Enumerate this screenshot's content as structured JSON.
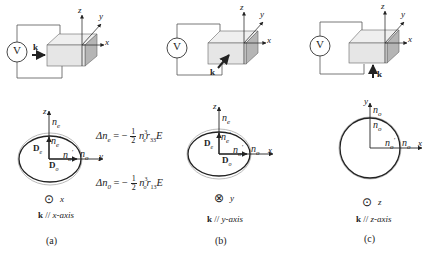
{
  "panels": [
    {
      "id": "a",
      "caption": "(a)",
      "k_direction_label": "k // x-axis",
      "k_bold": "k",
      "k_rest": " // ",
      "axis_name": "x-axis",
      "view_symbol": "⊙",
      "view_axis": "x",
      "voltage_label": "V",
      "k_arrow_label": "k",
      "crystal_axes": {
        "z": "z",
        "y": "y",
        "x": "x"
      },
      "ellipse_axes": {
        "vertical": "z",
        "horizontal": "y"
      },
      "labels": {
        "n_top": "n",
        "n_top_sub": "e",
        "n_inner_top": "n",
        "n_inner_top_sub": "e",
        "n_inner_top_prime": "′",
        "n_inner_right": "n",
        "n_inner_right_sub": "o",
        "n_inner_right_prime": "′",
        "n_right": "n",
        "n_right_sub": "o",
        "D_vertical": "D",
        "D_vertical_sub": "e",
        "D_horizontal": "D",
        "D_horizontal_sub": "o"
      },
      "equations": [
        {
          "lhs": "Δn",
          "lhs_sub": "e",
          "eq": " = −",
          "num": "1",
          "den": "2",
          "n": "n",
          "n_sub": "e",
          "n_sup": "3",
          "r": "r",
          "r_sub": "33",
          "E": "E"
        },
        {
          "lhs": "Δn",
          "lhs_sub": "0",
          "eq": " = −",
          "num": "1",
          "den": "2",
          "n": "n",
          "n_sub": "o",
          "n_sup": "3",
          "r": "r",
          "r_sub": "13",
          "E": "E"
        }
      ]
    },
    {
      "id": "b",
      "caption": "(b)",
      "k_bold": "k",
      "k_rest": " // ",
      "axis_name": "y-axis",
      "view_symbol": "⊗",
      "view_axis": "y",
      "voltage_label": "V",
      "k_arrow_label": "k",
      "crystal_axes": {
        "z": "z",
        "y": "y",
        "x": "x"
      },
      "ellipse_axes": {
        "vertical": "z",
        "horizontal": "x"
      },
      "labels": {
        "n_top": "n",
        "n_top_sub": "e",
        "n_inner_top": "n",
        "n_inner_top_sub": "e",
        "n_inner_top_prime": "′",
        "n_inner_right": "n",
        "n_inner_right_sub": "o",
        "n_inner_right_prime": "′",
        "n_right": "n",
        "n_right_sub": "o",
        "D_vertical": "D",
        "D_vertical_sub": "e",
        "D_horizontal": "D",
        "D_horizontal_sub": "o"
      }
    },
    {
      "id": "c",
      "caption": "(c)",
      "k_bold": "k",
      "k_rest": " // ",
      "axis_name": "z-axis",
      "view_symbol": "⊙",
      "view_axis": "z",
      "voltage_label": "V",
      "k_arrow_label": "k",
      "crystal_axes": {
        "z": "z",
        "y": "y",
        "x": "x"
      },
      "ellipse_axes": {
        "vertical": "y",
        "horizontal": "x"
      },
      "labels": {
        "n_top": "n",
        "n_top_sub": "o",
        "n_inner_top": "n",
        "n_inner_top_sub": "o",
        "n_inner_top_prime": "′",
        "n_inner_right": "n",
        "n_inner_right_sub": "o",
        "n_inner_right_prime": "′",
        "n_right": "n",
        "n_right_sub": "o"
      }
    }
  ],
  "colors": {
    "line": "#333333",
    "crystal_front": "#e6e6e6",
    "crystal_top": "#efefef",
    "crystal_side": "#b5b5b5",
    "outer_ellipse": "#bbbbbb"
  }
}
